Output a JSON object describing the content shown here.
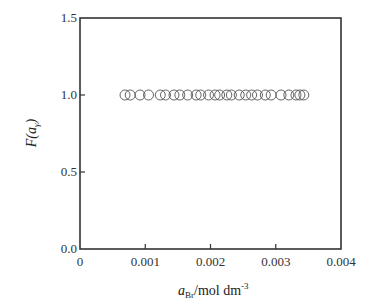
{
  "chart_data": {
    "type": "scatter",
    "title": "",
    "xlabel": "a_Br/mol dm^-3",
    "xlabel_parts": {
      "main": "a",
      "sub": "Br",
      "rest": "/mol dm",
      "sup": "-3"
    },
    "ylabel": "F(a_γ)",
    "ylabel_parts": {
      "pre": "F(",
      "main": "a",
      "sub": "γ",
      "post": ")"
    },
    "xlim": [
      0,
      0.004
    ],
    "ylim": [
      0.0,
      1.5
    ],
    "xticks": [
      0,
      0.001,
      0.002,
      0.003,
      0.004
    ],
    "xtick_labels": [
      "0",
      "0.001",
      "0.002",
      "0.003",
      "0.004"
    ],
    "yticks": [
      0.0,
      0.5,
      1.0,
      1.5
    ],
    "ytick_labels": [
      "0.0",
      "0.5",
      "1.0",
      "1.5"
    ],
    "grid": false,
    "legend": null,
    "marker": "open-circle",
    "series": [
      {
        "name": "F(a)",
        "x": [
          0.00069,
          0.00077,
          0.00092,
          0.00105,
          0.00123,
          0.00131,
          0.00144,
          0.00153,
          0.00165,
          0.00178,
          0.00185,
          0.00197,
          0.00207,
          0.00214,
          0.00225,
          0.00232,
          0.00244,
          0.00254,
          0.00263,
          0.00272,
          0.00284,
          0.00293,
          0.00308,
          0.0032,
          0.00331,
          0.00337,
          0.00343
        ],
        "y": [
          1.0,
          1.0,
          1.0,
          1.0,
          1.0,
          1.0,
          1.0,
          1.0,
          1.0,
          1.0,
          1.0,
          1.0,
          1.0,
          1.0,
          1.0,
          1.0,
          1.0,
          1.0,
          1.0,
          1.0,
          1.0,
          1.0,
          1.0,
          1.0,
          1.0,
          1.0,
          1.0
        ]
      }
    ]
  }
}
